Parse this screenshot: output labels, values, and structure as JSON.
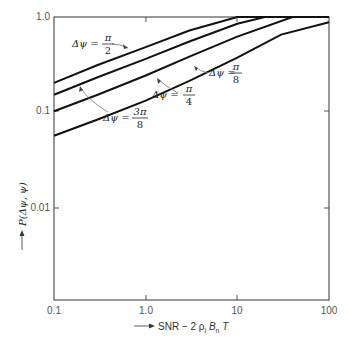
{
  "chart_data": {
    "type": "line",
    "title": "",
    "xlabel": "SNR - 2 ρ_i B_n T",
    "ylabel": "P(Δψ, ψ)",
    "xscale": "log",
    "yscale": "log",
    "xlim": [
      0.1,
      100
    ],
    "ylim": [
      0.001,
      1.0
    ],
    "x_ticks": [
      "0.1",
      "1.0",
      "10",
      "100"
    ],
    "y_ticks": [
      "1.0",
      "0.1",
      "0.01"
    ],
    "grid": false,
    "legend": "inline annotations",
    "series": [
      {
        "name": "Δψ = π/2",
        "label_num": "π",
        "label_den": "2",
        "x": [
          0.1,
          0.3,
          1.0,
          3.0,
          10,
          100
        ],
        "y": [
          0.2,
          0.31,
          0.48,
          0.72,
          1.0,
          1.0
        ]
      },
      {
        "name": "Δψ = 3π/8",
        "label_num": "3π",
        "label_den": "8",
        "x": [
          0.1,
          0.3,
          1.0,
          3.0,
          10,
          20,
          100
        ],
        "y": [
          0.15,
          0.23,
          0.36,
          0.55,
          0.85,
          1.0,
          1.0
        ]
      },
      {
        "name": "Δψ = π/4",
        "label_num": "π",
        "label_den": "4",
        "x": [
          0.1,
          0.3,
          1.0,
          3.0,
          10,
          40,
          100
        ],
        "y": [
          0.1,
          0.15,
          0.24,
          0.38,
          0.62,
          1.0,
          1.0
        ]
      },
      {
        "name": "Δψ = π/8",
        "label_num": "π",
        "label_den": "8",
        "x": [
          0.1,
          0.3,
          1.0,
          3.0,
          10,
          30,
          100
        ],
        "y": [
          0.055,
          0.082,
          0.13,
          0.21,
          0.37,
          0.65,
          0.88
        ]
      }
    ]
  },
  "labels": {
    "delta_psi": "Δψ =",
    "x_axis_title": "SNR − 2 ρ",
    "x_axis_title_sub": "i",
    "x_axis_title_b": " B",
    "x_axis_title_b_sub": "n",
    "x_axis_title_t": " T",
    "y_axis_title": "P(Δψ, ψ)"
  }
}
